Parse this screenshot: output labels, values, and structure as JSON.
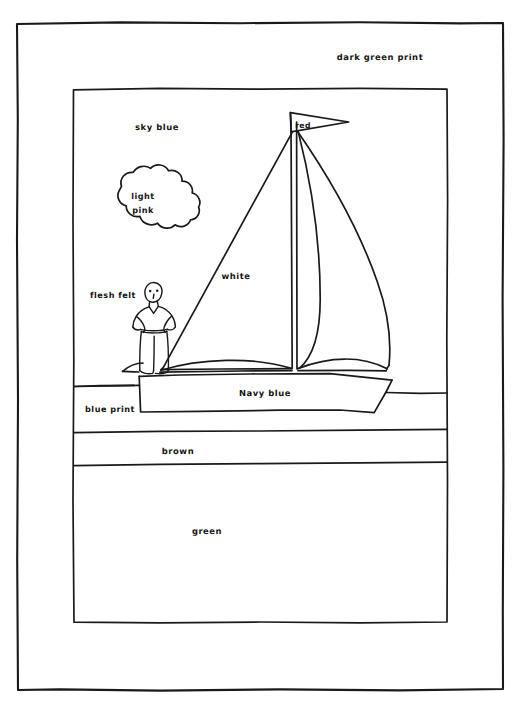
{
  "document": {
    "type": "line-drawing-pattern",
    "title": "Sailboat scene fabric placement diagram",
    "background_color": "#ffffff",
    "ink_color": "#1a1a1a"
  },
  "labels": {
    "border_fabric": "dark green print",
    "sky": "sky blue",
    "cloud": "light\npink",
    "cloud_line1": "light",
    "cloud_line2": "pink",
    "sails": "white",
    "flag": "red",
    "figure": "flesh felt",
    "water": "blue print",
    "hull": "Navy blue",
    "sand": "brown",
    "grass": "green"
  },
  "regions": [
    {
      "name": "outer-border",
      "label": "dark green print",
      "label_x": 380,
      "label_y": 60
    },
    {
      "name": "sky",
      "label": "sky blue",
      "label_x": 157,
      "label_y": 130
    },
    {
      "name": "cloud",
      "label": "light pink",
      "label_x": 143,
      "label_y": 199
    },
    {
      "name": "mainsail-jib",
      "label": "white",
      "label_x": 236,
      "label_y": 278
    },
    {
      "name": "pennant-flag",
      "label": "red",
      "label_x": 303,
      "label_y": 128
    },
    {
      "name": "sailor-figure",
      "label": "flesh felt",
      "label_x": 113,
      "label_y": 297
    },
    {
      "name": "water",
      "label": "blue print",
      "label_x": 110,
      "label_y": 412
    },
    {
      "name": "boat-hull",
      "label": "Navy blue",
      "label_x": 265,
      "label_y": 396
    },
    {
      "name": "sand-strip",
      "label": "brown",
      "label_x": 178,
      "label_y": 453
    },
    {
      "name": "grass-field",
      "label": "green",
      "label_x": 207,
      "label_y": 533
    }
  ],
  "frames": {
    "outer": {
      "x": 17,
      "y": 22,
      "width": 487,
      "height": 668
    },
    "inner": {
      "x": 73,
      "y": 88,
      "width": 375,
      "height": 535
    }
  }
}
